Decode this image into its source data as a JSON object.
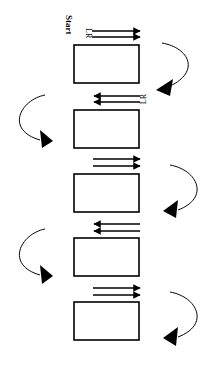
{
  "diagram": {
    "start_label": "Start",
    "direction_labels": [
      "LR",
      "LR"
    ],
    "colors": {
      "stroke": "#000000",
      "background": "#ffffff"
    },
    "boxes": [
      {
        "id": "box-1",
        "x": 74,
        "y": 45,
        "w": 65,
        "h": 38
      },
      {
        "id": "box-2",
        "x": 74,
        "y": 110,
        "w": 65,
        "h": 38
      },
      {
        "id": "box-3",
        "x": 74,
        "y": 174,
        "w": 65,
        "h": 38
      },
      {
        "id": "box-4",
        "x": 74,
        "y": 238,
        "w": 65,
        "h": 38
      },
      {
        "id": "box-5",
        "x": 74,
        "y": 302,
        "w": 65,
        "h": 38
      }
    ],
    "straight_arrows": [
      {
        "row": 1,
        "direction": "right",
        "y": [
          31,
          37
        ]
      },
      {
        "row": 2,
        "direction": "left",
        "y": [
          96,
          102
        ]
      },
      {
        "row": 3,
        "direction": "right",
        "y": [
          159,
          166
        ]
      },
      {
        "row": 4,
        "direction": "left",
        "y": [
          224,
          231
        ]
      },
      {
        "row": 5,
        "direction": "right",
        "y": [
          288,
          295
        ]
      }
    ],
    "curved_arrows": [
      {
        "side": "right",
        "from_box": 1,
        "to_box": 2
      },
      {
        "side": "left",
        "from_box": 2,
        "to_box": 3
      },
      {
        "side": "right",
        "from_box": 3,
        "to_box": 4
      },
      {
        "side": "left",
        "from_box": 4,
        "to_box": 5
      },
      {
        "side": "right",
        "from_box": 5,
        "to_box": null
      }
    ]
  }
}
